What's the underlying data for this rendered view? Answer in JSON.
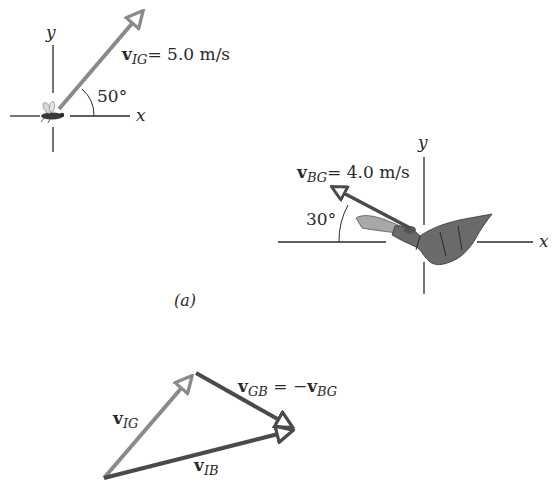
{
  "figure": {
    "panel_label": "(a)",
    "colors": {
      "vIG": "#8a8a8a",
      "vBG": "#4a4a4a",
      "vIB": "#4a4a4a",
      "axes": "#2a2a2a",
      "text": "#2a2a2a",
      "background": "#ffffff"
    }
  },
  "insect_frame": {
    "axis_x_label": "x",
    "axis_y_label": "y",
    "vector_symbol": "v",
    "vector_subscript": "IG",
    "vector_value": "= 5.0 m/s",
    "angle_label": "50°",
    "angle_deg": 50,
    "creature": "insect"
  },
  "bat_frame": {
    "axis_x_label": "x",
    "axis_y_label": "y",
    "vector_symbol": "v",
    "vector_subscript": "BG",
    "vector_value": "= 4.0 m/s",
    "angle_label": "30°",
    "angle_deg": 150,
    "creature": "bat"
  },
  "vector_triangle": {
    "vIG": {
      "symbol": "v",
      "subscript": "IG"
    },
    "vGB": {
      "symbol": "v",
      "subscript": "GB",
      "eq": " = −",
      "rhs_symbol": "v",
      "rhs_subscript": "BG"
    },
    "vIB": {
      "symbol": "v",
      "subscript": "IB"
    }
  }
}
